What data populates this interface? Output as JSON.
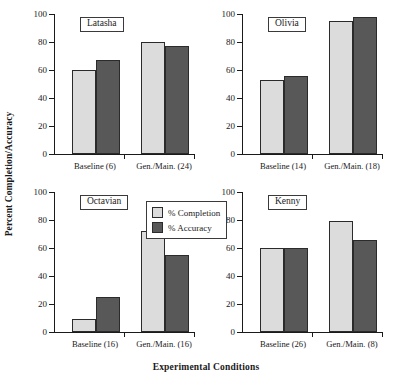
{
  "chart_data": {
    "type": "bar",
    "title": "",
    "xlabel": "Experimental Conditions",
    "ylabel": "Percent Completion/Accuracy",
    "ylim": [
      0,
      100
    ],
    "yticks": [
      0,
      20,
      40,
      60,
      80,
      100
    ],
    "grid": false,
    "legend": {
      "position": "center-left-of-lower-left-panel",
      "entries": [
        {
          "name": "% Completion",
          "color": "#dcdcdc"
        },
        {
          "name": "% Accuracy",
          "color": "#585858"
        }
      ]
    },
    "panel_layout": {
      "rows": 2,
      "cols": 2
    },
    "panels": [
      {
        "title": "Latasha",
        "categories": [
          "Baseline (6)",
          "Gen./Main. (24)"
        ],
        "series": [
          {
            "name": "% Completion",
            "values": [
              60,
              80
            ]
          },
          {
            "name": "% Accuracy",
            "values": [
              67,
              77
            ]
          }
        ]
      },
      {
        "title": "Olivia",
        "categories": [
          "Baseline (14)",
          "Gen./Main. (18)"
        ],
        "series": [
          {
            "name": "% Completion",
            "values": [
              53,
              95
            ]
          },
          {
            "name": "% Accuracy",
            "values": [
              56,
              98
            ]
          }
        ]
      },
      {
        "title": "Octavian",
        "categories": [
          "Baseline (16)",
          "Gen./Main. (16)"
        ],
        "series": [
          {
            "name": "% Completion",
            "values": [
              9,
              72
            ]
          },
          {
            "name": "% Accuracy",
            "values": [
              25,
              55
            ]
          }
        ]
      },
      {
        "title": "Kenny",
        "categories": [
          "Baseline (26)",
          "Gen./Main. (8)"
        ],
        "series": [
          {
            "name": "% Completion",
            "values": [
              60,
              79
            ]
          },
          {
            "name": "% Accuracy",
            "values": [
              60,
              66
            ]
          }
        ]
      }
    ]
  },
  "axis": {
    "ylabel": "Percent Completion/Accuracy",
    "xlabel": "Experimental Conditions",
    "yticks": [
      "100",
      "80",
      "60",
      "40",
      "20",
      "0"
    ]
  },
  "legend": {
    "completion_label": "% Completion",
    "accuracy_label": "% Accuracy"
  },
  "panels": [
    {
      "title": "Latasha",
      "xtick0": "Baseline (6)",
      "xtick1": "Gen./Main. (24)"
    },
    {
      "title": "Olivia",
      "xtick0": "Baseline (14)",
      "xtick1": "Gen./Main. (18)"
    },
    {
      "title": "Octavian",
      "xtick0": "Baseline (16)",
      "xtick1": "Gen./Main. (16)"
    },
    {
      "title": "Kenny",
      "xtick0": "Baseline (26)",
      "xtick1": "Gen./Main. (8)"
    }
  ],
  "colors": {
    "completion": "#dcdcdc",
    "accuracy": "#585858",
    "axis": "#1a1a1a",
    "background": "#ffffff"
  }
}
